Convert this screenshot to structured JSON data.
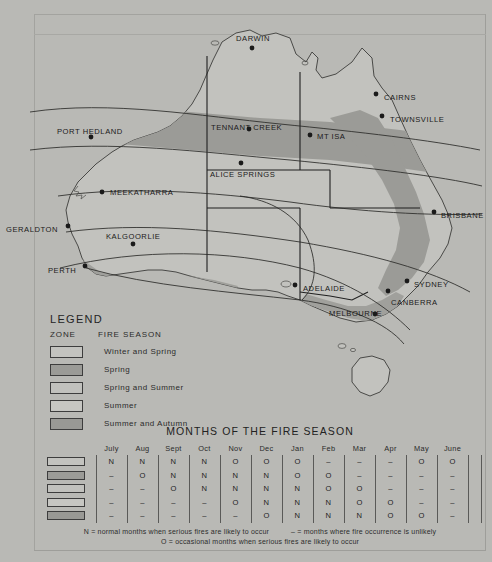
{
  "map": {
    "title": "Australia Fire Season Zones",
    "cities": [
      {
        "name": "DARWIN",
        "x": 252,
        "y": 48,
        "dx": 236,
        "dy": 38
      },
      {
        "name": "CAIRNS",
        "x": 376,
        "y": 94,
        "dx": 384,
        "dy": 97
      },
      {
        "name": "TOWNSVILLE",
        "x": 382,
        "y": 116,
        "dx": 390,
        "dy": 119
      },
      {
        "name": "PORT HEDLAND",
        "x": 91,
        "y": 137,
        "dx": 57,
        "dy": 131
      },
      {
        "name": "TENNANT CREEK",
        "x": 249,
        "y": 129,
        "dx": 211,
        "dy": 127
      },
      {
        "name": "MT ISA",
        "x": 310,
        "y": 135,
        "dx": 317,
        "dy": 136
      },
      {
        "name": "ALICE SPRINGS",
        "x": 241,
        "y": 163,
        "dx": 210,
        "dy": 174
      },
      {
        "name": "MEEKATHARRA",
        "x": 102,
        "y": 192,
        "dx": 110,
        "dy": 192
      },
      {
        "name": "GERALDTON",
        "x": 68,
        "y": 226,
        "dx": 6,
        "dy": 229
      },
      {
        "name": "BRISBANE",
        "x": 434,
        "y": 212,
        "dx": 441,
        "dy": 215
      },
      {
        "name": "KALGOORLIE",
        "x": 133,
        "y": 244,
        "dx": 106,
        "dy": 236
      },
      {
        "name": "PERTH",
        "x": 85,
        "y": 266,
        "dx": 48,
        "dy": 270
      },
      {
        "name": "SYDNEY",
        "x": 407,
        "y": 281,
        "dx": 414,
        "dy": 284
      },
      {
        "name": "ADELAIDE",
        "x": 295,
        "y": 285,
        "dx": 303,
        "dy": 288
      },
      {
        "name": "CANBERRA",
        "x": 388,
        "y": 291,
        "dx": 391,
        "dy": 302
      },
      {
        "name": "MELBOURNE",
        "x": 375,
        "y": 314,
        "dx": 329,
        "dy": 313
      }
    ]
  },
  "legend": {
    "title": "LEGEND",
    "col_zone": "ZONE",
    "col_season": "FIRE SEASON",
    "rows": [
      {
        "label": "Winter and Spring",
        "swatch": "sw-win"
      },
      {
        "label": "Spring",
        "swatch": "sw-spr"
      },
      {
        "label": "Spring and Summer",
        "swatch": "sw-sprsum"
      },
      {
        "label": "Summer",
        "swatch": "sw-sum"
      },
      {
        "label": "Summer and Autumn",
        "swatch": "sw-sumaut"
      }
    ]
  },
  "months": {
    "title": "MONTHS OF THE FIRE SEASON",
    "headers": [
      "July",
      "Aug",
      "Sept",
      "Oct",
      "Nov",
      "Dec",
      "Jan",
      "Feb",
      "Mar",
      "Apr",
      "May",
      "June"
    ],
    "rows": [
      {
        "swatch": "sw-win",
        "values": [
          "N",
          "N",
          "N",
          "N",
          "O",
          "O",
          "O",
          "–",
          "–",
          "–",
          "O",
          "O"
        ]
      },
      {
        "swatch": "sw-spr",
        "values": [
          "–",
          "O",
          "N",
          "N",
          "N",
          "N",
          "O",
          "O",
          "–",
          "–",
          "–",
          "–"
        ]
      },
      {
        "swatch": "sw-sprsum",
        "values": [
          "–",
          "–",
          "O",
          "N",
          "N",
          "N",
          "N",
          "O",
          "O",
          "–",
          "–",
          "–"
        ]
      },
      {
        "swatch": "sw-sum",
        "values": [
          "–",
          "–",
          "–",
          "–",
          "O",
          "N",
          "N",
          "N",
          "O",
          "O",
          "–",
          "–"
        ]
      },
      {
        "swatch": "sw-sumaut",
        "values": [
          "–",
          "–",
          "–",
          "–",
          "–",
          "O",
          "N",
          "N",
          "N",
          "O",
          "O",
          "–"
        ]
      }
    ],
    "note_line1_a": "N  =  normal months when serious fires are likely to occur",
    "note_line1_b": "–  =  months where fire occurrence is unlikely",
    "note_line2": "O  =  occasional months when serious fires are likely to occur"
  },
  "colors": {
    "background": "#b9b9b5",
    "land_light": "#c2c2be",
    "land_dark": "#9b9b97",
    "ink": "#1a1a1a"
  }
}
